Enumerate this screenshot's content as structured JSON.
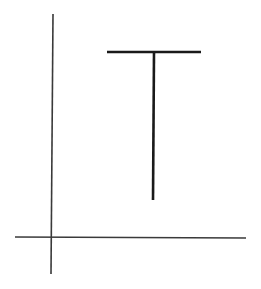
{
  "canvas": {
    "width": 261,
    "height": 289,
    "background": "#ffffff"
  },
  "axes": {
    "vertical": {
      "x1": 53,
      "y1": 14,
      "x2": 51,
      "y2": 274,
      "color": "#3a3a3a",
      "width": 1.6
    },
    "horizontal": {
      "x1": 15,
      "y1": 237,
      "x2": 246,
      "y2": 238,
      "color": "#3a3a3a",
      "width": 1.6
    }
  },
  "t_shape": {
    "crossbar": {
      "x1": 107,
      "y1": 52,
      "x2": 201,
      "y2": 52,
      "color": "#1a1a1a",
      "width": 2.6
    },
    "stem": {
      "x1": 154,
      "y1": 52,
      "x2": 153,
      "y2": 200,
      "color": "#1a1a1a",
      "width": 2.6
    }
  }
}
